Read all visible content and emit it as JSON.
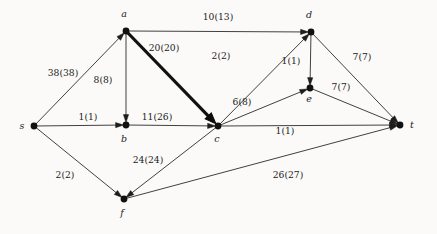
{
  "figure": {
    "type": "flow-network-diagram",
    "background_color": "#fbfaf8",
    "ink_color": "#1a1a1a",
    "label_format": "flow(capacity)"
  },
  "nodes": [
    {
      "id": "s",
      "label": "s",
      "x": 34,
      "y": 126,
      "label_x": 22,
      "label_y": 129
    },
    {
      "id": "a",
      "label": "a",
      "x": 126,
      "y": 31,
      "label_x": 124,
      "label_y": 17
    },
    {
      "id": "b",
      "label": "b",
      "x": 126,
      "y": 125,
      "label_x": 124,
      "label_y": 142
    },
    {
      "id": "c",
      "label": "c",
      "x": 218,
      "y": 126,
      "label_x": 217,
      "label_y": 142
    },
    {
      "id": "d",
      "label": "d",
      "x": 311,
      "y": 32,
      "label_x": 309,
      "label_y": 18
    },
    {
      "id": "e",
      "label": "e",
      "x": 310,
      "y": 88,
      "label_x": 309,
      "label_y": 102
    },
    {
      "id": "f",
      "label": "f",
      "x": 124,
      "y": 199,
      "label_x": 122,
      "label_y": 216
    },
    {
      "id": "t",
      "label": "t",
      "x": 400,
      "y": 125,
      "label_x": 412,
      "label_y": 128
    }
  ],
  "edges": [
    {
      "id": "s-a",
      "from": "s",
      "to": "a",
      "flow": 38,
      "capacity": 38,
      "label": "38(38)",
      "label_x": 63,
      "label_y": 76,
      "thick": false
    },
    {
      "id": "s-b",
      "from": "s",
      "to": "b",
      "flow": 1,
      "capacity": 1,
      "label": "1(1)",
      "label_x": 88,
      "label_y": 120,
      "thick": false
    },
    {
      "id": "s-f",
      "from": "s",
      "to": "f",
      "flow": 2,
      "capacity": 2,
      "label": "2(2)",
      "label_x": 65,
      "label_y": 178,
      "thick": false
    },
    {
      "id": "a-d",
      "from": "a",
      "to": "d",
      "flow": 10,
      "capacity": 13,
      "label": "10(13)",
      "label_x": 218,
      "label_y": 20,
      "thick": false
    },
    {
      "id": "a-b",
      "from": "a",
      "to": "b",
      "flow": 8,
      "capacity": 8,
      "label": "8(8)",
      "label_x": 103,
      "label_y": 83,
      "thick": false
    },
    {
      "id": "a-c",
      "from": "a",
      "to": "c",
      "flow": 20,
      "capacity": 20,
      "label": "20(20)",
      "label_x": 164,
      "label_y": 51,
      "thick": true
    },
    {
      "id": "b-c",
      "from": "b",
      "to": "c",
      "flow": 11,
      "capacity": 26,
      "label": "11(26)",
      "label_x": 157,
      "label_y": 120,
      "thick": false
    },
    {
      "id": "c-d",
      "from": "c",
      "to": "d",
      "flow": 2,
      "capacity": 2,
      "label": "2(2)",
      "label_x": 221,
      "label_y": 59,
      "thick": false
    },
    {
      "id": "c-e",
      "from": "c",
      "to": "e",
      "flow": 6,
      "capacity": 8,
      "label": "6(8)",
      "label_x": 242,
      "label_y": 105,
      "thick": false
    },
    {
      "id": "c-t",
      "from": "c",
      "to": "t",
      "flow": 1,
      "capacity": 1,
      "label": "1(1)",
      "label_x": 285,
      "label_y": 134,
      "thick": false
    },
    {
      "id": "c-f",
      "from": "c",
      "to": "f",
      "flow": 24,
      "capacity": 24,
      "label": "24(24)",
      "label_x": 148,
      "label_y": 163,
      "thick": false
    },
    {
      "id": "d-e",
      "from": "d",
      "to": "e",
      "flow": 1,
      "capacity": 1,
      "label": "1(1)",
      "label_x": 291,
      "label_y": 64,
      "thick": false
    },
    {
      "id": "d-t",
      "from": "d",
      "to": "t",
      "flow": 7,
      "capacity": 7,
      "label": "7(7)",
      "label_x": 362,
      "label_y": 60,
      "thick": false
    },
    {
      "id": "e-t",
      "from": "e",
      "to": "t",
      "flow": 7,
      "capacity": 7,
      "label": "7(7)",
      "label_x": 341,
      "label_y": 90,
      "thick": false
    },
    {
      "id": "f-t",
      "from": "f",
      "to": "t",
      "flow": 26,
      "capacity": 27,
      "label": "26(27)",
      "label_x": 288,
      "label_y": 178,
      "thick": false
    }
  ]
}
